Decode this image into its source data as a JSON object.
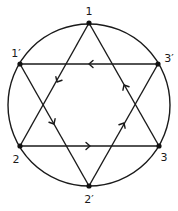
{
  "diagram": {
    "circle": {
      "cx": 89,
      "cy": 105,
      "r": 81
    },
    "nodes": [
      {
        "id": "1",
        "label": "1",
        "x": 89,
        "y": 23,
        "lx": 89,
        "ly": 15
      },
      {
        "id": "1p",
        "label": "1′",
        "x": 20,
        "y": 64,
        "lx": 16,
        "ly": 56
      },
      {
        "id": "3p",
        "label": "3′",
        "x": 158,
        "y": 64,
        "lx": 169,
        "ly": 62
      },
      {
        "id": "2",
        "label": "2",
        "x": 20,
        "y": 146,
        "lx": 16,
        "ly": 163
      },
      {
        "id": "3",
        "label": "3",
        "x": 159,
        "y": 146,
        "lx": 163,
        "ly": 161
      },
      {
        "id": "2p",
        "label": "2′",
        "x": 89,
        "y": 186,
        "lx": 89,
        "ly": 203
      }
    ],
    "triangles": [
      {
        "name": "unprimed",
        "cycle": [
          "1",
          "2",
          "3"
        ]
      },
      {
        "name": "primed",
        "cycle": [
          "1′",
          "2′",
          "3′"
        ]
      }
    ],
    "edges": [
      {
        "from": "1",
        "to": "2",
        "direction": "1→2",
        "arrow_at": [
          57,
          82
        ]
      },
      {
        "from": "2",
        "to": "3",
        "direction": "2→3",
        "arrow_at": [
          89,
          146
        ]
      },
      {
        "from": "3",
        "to": "1",
        "direction": "3→1",
        "arrow_at": [
          124,
          86
        ]
      },
      {
        "from": "1p",
        "to": "2p",
        "direction": "1′→2′",
        "arrow_at": [
          53,
          123
        ]
      },
      {
        "from": "2p",
        "to": "3p",
        "direction": "2′→3′",
        "arrow_at": [
          124,
          123
        ]
      },
      {
        "from": "3p",
        "to": "1p",
        "direction": "3′→1′",
        "arrow_at": [
          90,
          64
        ]
      }
    ],
    "colors": {
      "stroke": "#1a1a1a",
      "node": "#111111",
      "background": "#ffffff"
    }
  }
}
